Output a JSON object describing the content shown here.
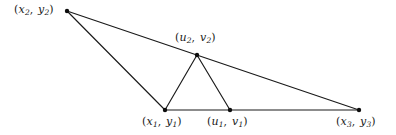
{
  "figure": {
    "background_color": "#ffffff",
    "stroke_color": "#1a1a1a",
    "vertex_color": "#0d0d0d",
    "width": 396,
    "height": 135,
    "points": [
      {
        "id": "x2y2",
        "name": "vertex-x2-y2",
        "label": "(x2, y2)",
        "var1": "x",
        "sub1": "2",
        "var2": "y",
        "sub2": "2",
        "x": 67,
        "y": 11,
        "label_x": 14,
        "label_y": 4
      },
      {
        "id": "u2v2",
        "name": "vertex-u2-v2",
        "label": "(u2, v2)",
        "var1": "u",
        "sub1": "2",
        "var2": "v",
        "sub2": "2",
        "x": 197,
        "y": 55,
        "label_x": 175,
        "label_y": 32
      },
      {
        "id": "x1y1",
        "name": "vertex-x1-y1",
        "label": "(x1, y1)",
        "var1": "x",
        "sub1": "1",
        "var2": "y",
        "sub2": "1",
        "x": 165,
        "y": 110,
        "label_x": 142,
        "label_y": 116
      },
      {
        "id": "u1v1",
        "name": "vertex-u1-v1",
        "label": "(u1, v1)",
        "var1": "u",
        "sub1": "1",
        "var2": "v",
        "sub2": "1",
        "x": 230,
        "y": 110,
        "label_x": 207,
        "label_y": 116
      },
      {
        "id": "x3y3",
        "name": "vertex-x3-y3",
        "label": "(x3, y3)",
        "var1": "x",
        "sub1": "3",
        "var2": "y",
        "sub2": "3",
        "x": 359,
        "y": 110,
        "label_x": 336,
        "label_y": 116
      }
    ],
    "edges": [
      {
        "name": "edge-x2y2-to-x3y3",
        "from": "x2y2",
        "to": "x3y3"
      },
      {
        "name": "edge-x2y2-to-x1y1",
        "from": "x2y2",
        "to": "x1y1"
      },
      {
        "name": "edge-x1y1-to-x3y3",
        "from": "x1y1",
        "to": "x3y3"
      },
      {
        "name": "edge-x1y1-to-u2v2",
        "from": "x1y1",
        "to": "u2v2"
      },
      {
        "name": "edge-u2v2-to-u1v1",
        "from": "u2v2",
        "to": "u1v1"
      }
    ],
    "vertex_radius": 2.2
  }
}
